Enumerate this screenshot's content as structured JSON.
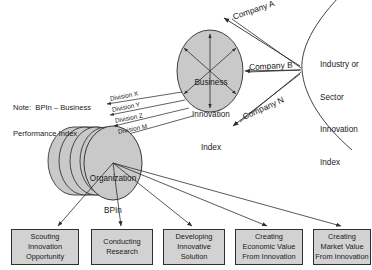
{
  "diagram": {
    "note": {
      "line1": "Note:  BPIn – Business",
      "line2": "Performance Index"
    },
    "industry_node": {
      "line1": "Industry or",
      "line2": "Sector",
      "line3": "Innovation",
      "line4": "Index"
    },
    "business_node": {
      "line1": "Business",
      "line2": "Innovation",
      "line3": "Index"
    },
    "organization_node": {
      "line1": "Organization",
      "line2": "BPIn"
    },
    "company_links": [
      {
        "label": "Company  A"
      },
      {
        "label": "Company  B"
      },
      {
        "label": "Company  N"
      }
    ],
    "division_links": [
      {
        "label": "Division X"
      },
      {
        "label": "Division Y"
      },
      {
        "label": "Division Z"
      },
      {
        "label": "Division M"
      }
    ],
    "outcome_boxes": [
      {
        "line1": "Scouting",
        "line2": "Innovation",
        "line3": "Opportunity"
      },
      {
        "line1": "Conducting",
        "line2": "Research",
        "line3": ""
      },
      {
        "line1": "Developing",
        "line2": "Innovative",
        "line3": "Solution"
      },
      {
        "line1": "Creating",
        "line2": "Economic Value",
        "line3": "From Innovation"
      },
      {
        "line1": "Creating",
        "line2": "Market Value",
        "line3": "From Innovation"
      }
    ],
    "colors": {
      "node_fill": "#c9c9c9",
      "box_fill": "#d2d2d2",
      "stroke": "#2e2e2e",
      "background": "#ffffff"
    }
  }
}
